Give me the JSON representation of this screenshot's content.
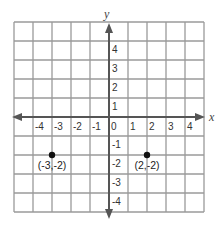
{
  "diagram": {
    "type": "coordinate-plane",
    "x_axis_label": "x",
    "y_axis_label": "y",
    "x_range": [
      -5,
      5
    ],
    "y_range": [
      -5,
      5
    ],
    "x_tick_labels": [
      "-4",
      "-3",
      "-2",
      "-1",
      "0",
      "1",
      "2",
      "3",
      "4"
    ],
    "y_tick_labels": [
      "4",
      "3",
      "2",
      "1",
      "-1",
      "-2",
      "-3",
      "-4"
    ],
    "points": [
      {
        "x": -3,
        "y": -2,
        "label": "(-3,-2)"
      },
      {
        "x": 2,
        "y": -2,
        "label": "(2,-2)"
      }
    ],
    "colors": {
      "grid": "#9a9a9a",
      "axis": "#555555",
      "point": "#111111",
      "background": "#ffffff"
    }
  }
}
